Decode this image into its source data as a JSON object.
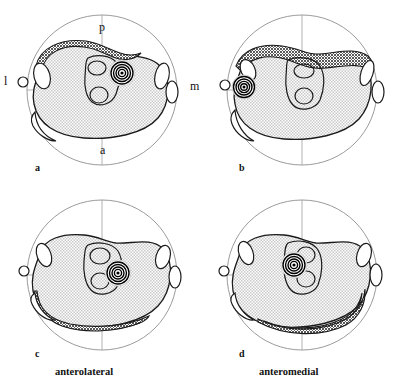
{
  "figure": {
    "type": "anatomical-cross-section-diagram",
    "panels": [
      {
        "id": "a",
        "label": "a",
        "caption": "",
        "target_marker": {
          "name": "concentric-target",
          "x_pct": 61,
          "y_pct": 45,
          "rings": 5
        },
        "dark_region": "posterolateral band upper-left",
        "light_region": "central body"
      },
      {
        "id": "b",
        "label": "b",
        "caption": "",
        "target_marker": {
          "name": "concentric-target",
          "x_pct": 22,
          "y_pct": 53,
          "rings": 5
        },
        "dark_region": "posterior band across top-right",
        "light_region": "central body"
      },
      {
        "id": "c",
        "label": "c",
        "caption": "anterolateral",
        "target_marker": {
          "name": "concentric-target",
          "x_pct": 60,
          "y_pct": 51,
          "rings": 5
        },
        "dark_region": "anterolateral band lower-left",
        "light_region": "central body"
      },
      {
        "id": "d",
        "label": "d",
        "caption": "anteromedial",
        "target_marker": {
          "name": "concentric-target",
          "x_pct": 54,
          "y_pct": 44,
          "rings": 5
        },
        "dark_region": "anteromedial band lower-right",
        "light_region": "central body"
      }
    ],
    "axis_labels": {
      "posterior": "p",
      "anterior": "a",
      "lateral": "l",
      "medial": "m"
    },
    "colors": {
      "outline": "#1a1a1a",
      "circle_boundary": "#8a8a8a",
      "axis_line": "#9a9a9a",
      "light_stipple": "#d6d6d6",
      "dark_stipple": "#6e6e6e",
      "background": "#ffffff",
      "marker": "#000000"
    }
  }
}
